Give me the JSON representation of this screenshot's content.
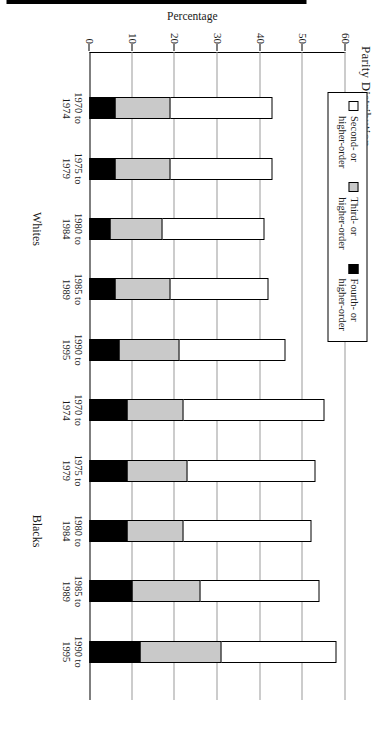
{
  "chart_data": {
    "type": "bar",
    "title": "Parity Distribution",
    "xlabel": "",
    "ylabel": "Percentage",
    "ylim": [
      0,
      60
    ],
    "yticks": [
      0,
      10,
      20,
      30,
      40,
      50,
      60
    ],
    "grid": true,
    "legend_position": "top-left",
    "orientation": "vertical",
    "group_labels": [
      "Whites",
      "Blacks"
    ],
    "categories": [
      "1970 to\n1974",
      "1975 to\n1979",
      "1980 to\n1984",
      "1985 to\n1989",
      "1990 to\n1995",
      "1970 to\n1974",
      "1975 to\n1979",
      "1980 to\n1984",
      "1985 to\n1989",
      "1990 to\n1995"
    ],
    "series": [
      {
        "name": "Second- or higher-order",
        "color": "#ffffff",
        "values": [
          43,
          43,
          41,
          42,
          46,
          55,
          53,
          52,
          54,
          58
        ]
      },
      {
        "name": "Third- or higher-order",
        "color": "#c9c9c9",
        "values": [
          19,
          19,
          17,
          19,
          21,
          22,
          23,
          22,
          26,
          31
        ]
      },
      {
        "name": "Fourth- or higher-order",
        "color": "#000000",
        "values": [
          6,
          6,
          5,
          6,
          7,
          9,
          9,
          9,
          10,
          12
        ]
      }
    ]
  },
  "chart": {
    "title": "Parity Distribution",
    "y_axis_label": "Percentage",
    "y_tick_labels": [
      "0",
      "10",
      "20",
      "30",
      "40",
      "50",
      "60"
    ],
    "groups": [
      {
        "label": "Whites",
        "categories": [
          {
            "line1": "1970 to",
            "line2": "1974",
            "second": 43,
            "third": 19,
            "fourth": 6
          },
          {
            "line1": "1975 to",
            "line2": "1979",
            "second": 43,
            "third": 19,
            "fourth": 6
          },
          {
            "line1": "1980 to",
            "line2": "1984",
            "second": 41,
            "third": 17,
            "fourth": 5
          },
          {
            "line1": "1985 to",
            "line2": "1989",
            "second": 42,
            "third": 19,
            "fourth": 6
          },
          {
            "line1": "1990 to",
            "line2": "1995",
            "second": 46,
            "third": 21,
            "fourth": 7
          }
        ]
      },
      {
        "label": "Blacks",
        "categories": [
          {
            "line1": "1970 to",
            "line2": "1974",
            "second": 55,
            "third": 22,
            "fourth": 9
          },
          {
            "line1": "1975 to",
            "line2": "1979",
            "second": 53,
            "third": 23,
            "fourth": 9
          },
          {
            "line1": "1980 to",
            "line2": "1984",
            "second": 52,
            "third": 22,
            "fourth": 9
          },
          {
            "line1": "1985 to",
            "line2": "1989",
            "second": 54,
            "third": 26,
            "fourth": 10
          },
          {
            "line1": "1990 to",
            "line2": "1995",
            "second": 58,
            "third": 31,
            "fourth": 12
          }
        ]
      }
    ],
    "legend": {
      "items": [
        {
          "label_line1": "Second- or",
          "label_line2": "higher-order",
          "swatch": "white-swatch"
        },
        {
          "label_line1": "Third- or",
          "label_line2": "higher-order",
          "swatch": "gray-swatch"
        },
        {
          "label_line1": "Fourth- or",
          "label_line2": "higher-order",
          "swatch": "black-swatch"
        }
      ]
    }
  }
}
